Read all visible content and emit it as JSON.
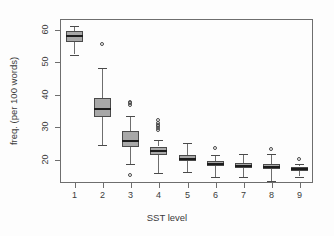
{
  "chart_data": {
    "type": "box",
    "title": "",
    "xlabel": "SST level",
    "ylabel": "freq. (per 100 words)",
    "categories": [
      "1",
      "2",
      "3",
      "4",
      "5",
      "6",
      "7",
      "8",
      "9"
    ],
    "xtick_labels": [
      "1",
      "2",
      "3",
      "4",
      "5",
      "6",
      "7",
      "8",
      "9"
    ],
    "ytick_labels": [
      "20",
      "30",
      "40",
      "50",
      "60"
    ],
    "ytick_values": [
      20,
      30,
      40,
      50,
      60
    ],
    "ylim": [
      12.5,
      63
    ],
    "xlim": [
      0.5,
      9.5
    ],
    "grid": false,
    "legend": false,
    "box_fill": "#a8a8a8",
    "box_stroke": "#4a4a4a",
    "median_color": "#1c1c1c",
    "axis_color": "#6e6e6e",
    "background": "#fdfdfd",
    "boxes": [
      {
        "category": "1",
        "lower_whisker": 52.0,
        "q1": 55.8,
        "median": 57.8,
        "q3": 59.2,
        "upper_whisker": 60.8,
        "outliers": []
      },
      {
        "category": "2",
        "lower_whisker": 24.3,
        "q1": 32.8,
        "median": 35.2,
        "q3": 38.6,
        "upper_whisker": 48.0,
        "outliers": [
          55.3
        ]
      },
      {
        "category": "3",
        "lower_whisker": 18.4,
        "q1": 23.7,
        "median": 25.5,
        "q3": 28.5,
        "upper_whisker": 33.0,
        "outliers": [
          36.4,
          37.1,
          37.5,
          15.1
        ]
      },
      {
        "category": "4",
        "lower_whisker": 15.5,
        "q1": 21.0,
        "median": 22.2,
        "q3": 23.6,
        "upper_whisker": 25.6,
        "outliers": [
          28.8,
          29.4,
          29.9,
          30.4,
          31.0,
          32.0
        ]
      },
      {
        "category": "5",
        "lower_whisker": 15.8,
        "q1": 19.2,
        "median": 20.0,
        "q3": 21.2,
        "upper_whisker": 24.8,
        "outliers": []
      },
      {
        "category": "6",
        "lower_whisker": 14.4,
        "q1": 17.8,
        "median": 18.4,
        "q3": 19.4,
        "upper_whisker": 21.2,
        "outliers": [
          23.2
        ]
      },
      {
        "category": "7",
        "lower_whisker": 14.4,
        "q1": 17.2,
        "median": 17.8,
        "q3": 18.8,
        "upper_whisker": 21.5,
        "outliers": []
      },
      {
        "category": "8",
        "lower_whisker": 13.2,
        "q1": 16.8,
        "median": 17.4,
        "q3": 18.3,
        "upper_whisker": 21.3,
        "outliers": [
          22.9
        ]
      },
      {
        "category": "9",
        "lower_whisker": 14.4,
        "q1": 16.4,
        "median": 16.9,
        "q3": 17.5,
        "upper_whisker": 18.2,
        "outliers": [
          19.9
        ]
      }
    ]
  },
  "geometry": {
    "plot_left": 60,
    "plot_top": 19,
    "plot_right": 313,
    "plot_bottom": 183
  }
}
